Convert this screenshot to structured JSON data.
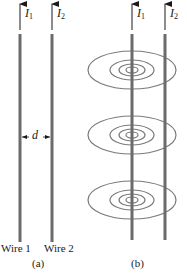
{
  "figure": {
    "panel_a": {
      "caption": "(a)",
      "wires": [
        {
          "name": "Wire 1",
          "current_symbol": "I",
          "current_subscript": "1"
        },
        {
          "name": "Wire 2",
          "current_symbol": "I",
          "current_subscript": "2"
        }
      ],
      "separation_label": "d"
    },
    "panel_b": {
      "caption": "(b)",
      "wires": [
        {
          "current_symbol": "I",
          "current_subscript": "1"
        },
        {
          "current_symbol": "I",
          "current_subscript": "2"
        }
      ],
      "field_ring_groups": 3
    }
  },
  "colors": {
    "wire": "#6b6b6b",
    "field_lines": "#7a7a7a",
    "text": "#1a1a1a",
    "arrow": "#1a1a1a"
  }
}
